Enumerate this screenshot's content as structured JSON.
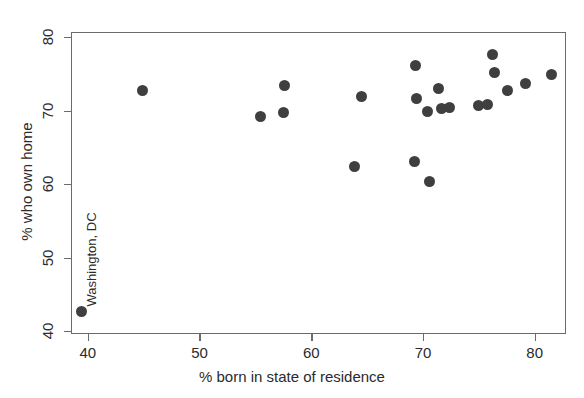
{
  "chart_data": {
    "type": "scatter",
    "title": "",
    "xlabel": "% born in state of residence",
    "ylabel": "% who own home",
    "xlim": [
      38.5,
      82.8
    ],
    "ylim": [
      39.6,
      80.7
    ],
    "xticks": [
      40,
      50,
      60,
      70,
      80
    ],
    "yticks": [
      40,
      50,
      60,
      70,
      80
    ],
    "xticklabels": [
      "40",
      "50",
      "60",
      "70",
      "80"
    ],
    "yticklabels": [
      "40",
      "50",
      "60",
      "70",
      "80"
    ],
    "grid": false,
    "legend": null,
    "marker": {
      "shape": "circle",
      "color": "#3f3f3f",
      "size_px": 11
    },
    "points": [
      {
        "x": 39.4,
        "y": 42.6,
        "label": "Washington, DC"
      },
      {
        "x": 44.9,
        "y": 72.8,
        "label": ""
      },
      {
        "x": 55.5,
        "y": 69.2,
        "label": ""
      },
      {
        "x": 57.5,
        "y": 69.8,
        "label": ""
      },
      {
        "x": 57.6,
        "y": 73.4,
        "label": ""
      },
      {
        "x": 63.9,
        "y": 62.4,
        "label": ""
      },
      {
        "x": 64.5,
        "y": 71.9,
        "label": ""
      },
      {
        "x": 69.3,
        "y": 76.1,
        "label": ""
      },
      {
        "x": 69.2,
        "y": 63.1,
        "label": ""
      },
      {
        "x": 69.4,
        "y": 71.6,
        "label": ""
      },
      {
        "x": 70.6,
        "y": 60.4,
        "label": ""
      },
      {
        "x": 70.4,
        "y": 69.9,
        "label": ""
      },
      {
        "x": 71.4,
        "y": 73.0,
        "label": ""
      },
      {
        "x": 71.7,
        "y": 70.3,
        "label": ""
      },
      {
        "x": 72.4,
        "y": 70.4,
        "label": ""
      },
      {
        "x": 75.0,
        "y": 70.7,
        "label": ""
      },
      {
        "x": 75.8,
        "y": 70.9,
        "label": ""
      },
      {
        "x": 76.2,
        "y": 77.6,
        "label": ""
      },
      {
        "x": 76.4,
        "y": 75.2,
        "label": ""
      },
      {
        "x": 77.6,
        "y": 72.7,
        "label": ""
      },
      {
        "x": 79.2,
        "y": 73.7,
        "label": ""
      },
      {
        "x": 81.5,
        "y": 74.9,
        "label": ""
      }
    ],
    "annotations": [
      {
        "text": "Washington, DC",
        "rotation": 90,
        "for_point_index": 0
      }
    ]
  }
}
